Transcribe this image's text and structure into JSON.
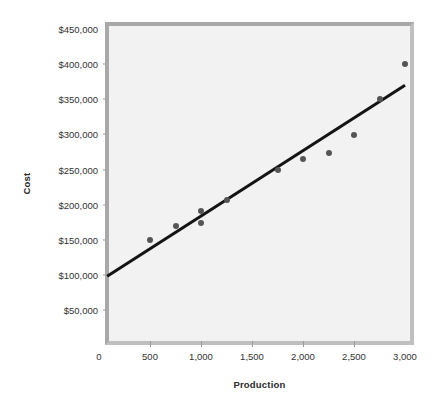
{
  "chart_data": {
    "type": "scatter",
    "title": "",
    "xlabel": "Production",
    "ylabel": "Cost",
    "xlim": [
      0,
      3000
    ],
    "ylim": [
      0,
      450000
    ],
    "grid": false,
    "legend": "none",
    "x_ticks": [
      {
        "value": 0,
        "label": "0"
      },
      {
        "value": 500,
        "label": "500"
      },
      {
        "value": 1000,
        "label": "1,000"
      },
      {
        "value": 1500,
        "label": "1,500"
      },
      {
        "value": 2000,
        "label": "2,000"
      },
      {
        "value": 2500,
        "label": "2,500"
      },
      {
        "value": 3000,
        "label": "3,000"
      }
    ],
    "y_ticks": [
      {
        "value": 50000,
        "label": "$50,000"
      },
      {
        "value": 100000,
        "label": "$100,000"
      },
      {
        "value": 150000,
        "label": "$150,000"
      },
      {
        "value": 200000,
        "label": "$200,000"
      },
      {
        "value": 250000,
        "label": "$250,000"
      },
      {
        "value": 300000,
        "label": "$300,000"
      },
      {
        "value": 350000,
        "label": "$350,000"
      },
      {
        "value": 400000,
        "label": "$400,000"
      },
      {
        "value": 450000,
        "label": "$450,000"
      }
    ],
    "series": [
      {
        "name": "Observed cost",
        "type": "scatter",
        "marker_color": "#555555",
        "points": [
          {
            "x": 500,
            "y": 150000
          },
          {
            "x": 750,
            "y": 170000
          },
          {
            "x": 1000,
            "y": 191000
          },
          {
            "x": 1000,
            "y": 174000
          },
          {
            "x": 1250,
            "y": 207000
          },
          {
            "x": 1750,
            "y": 250000
          },
          {
            "x": 2000,
            "y": 265000
          },
          {
            "x": 2250,
            "y": 274000
          },
          {
            "x": 2500,
            "y": 299000
          },
          {
            "x": 2750,
            "y": 351000
          },
          {
            "x": 3000,
            "y": 400000
          }
        ]
      },
      {
        "name": "Regression line",
        "type": "line",
        "line_color": "#141414",
        "line_width": 3,
        "endpoints": [
          {
            "x": 80,
            "y": 98000
          },
          {
            "x": 3000,
            "y": 370000
          }
        ]
      }
    ]
  },
  "axes": {
    "y_axis_title": "Cost",
    "x_axis_title": "Production"
  },
  "colors": {
    "plot_background": "#f2f2f2",
    "frame": "#a8a8a8",
    "marker": "#555555",
    "trend_line": "#141414",
    "tick_text": "#333333",
    "axis_title_text": "#2b2b2b"
  }
}
